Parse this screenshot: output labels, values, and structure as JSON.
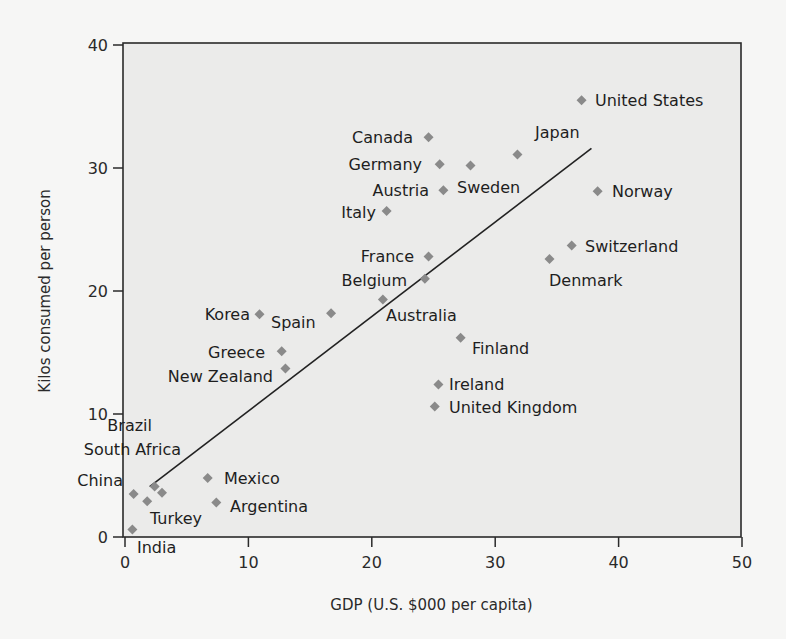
{
  "chart_data": {
    "type": "scatter",
    "title": "",
    "xlabel": "GDP (U.S. $000 per capita)",
    "ylabel": "Kilos consumed per person",
    "xlim": [
      0,
      50
    ],
    "ylim": [
      0,
      40
    ],
    "xticks": [
      0,
      10,
      20,
      30,
      40,
      50
    ],
    "yticks": [
      0,
      10,
      20,
      30,
      40
    ],
    "grid": false,
    "legend": null,
    "marker": {
      "shape": "diamond",
      "color": "#8a8a8a"
    },
    "trendline": {
      "type": "linear",
      "x": [
        2.0,
        37.8
      ],
      "y": [
        4.1,
        31.6
      ],
      "color": "#222222"
    },
    "points": [
      {
        "label": "United States",
        "x": 37.0,
        "y": 35.5,
        "lx": 595,
        "ly": 106,
        "anchor": "start"
      },
      {
        "label": "Japan",
        "x": 31.8,
        "y": 31.1,
        "lx": 535,
        "ly": 138,
        "anchor": "start"
      },
      {
        "label": "Canada",
        "x": 24.6,
        "y": 32.5,
        "lx": 413,
        "ly": 143,
        "anchor": "end"
      },
      {
        "label": "Germany",
        "x": 25.5,
        "y": 30.3,
        "lx": 422,
        "ly": 170,
        "anchor": "end"
      },
      {
        "label": "Sweden",
        "x": 28.0,
        "y": 30.2,
        "lx": 457,
        "ly": 193,
        "anchor": "start"
      },
      {
        "label": "Austria",
        "x": 25.8,
        "y": 28.2,
        "lx": 429,
        "ly": 196,
        "anchor": "end"
      },
      {
        "label": "Norway",
        "x": 38.3,
        "y": 28.1,
        "lx": 612,
        "ly": 197,
        "anchor": "start"
      },
      {
        "label": "Italy",
        "x": 21.2,
        "y": 26.5,
        "lx": 376,
        "ly": 218,
        "anchor": "end"
      },
      {
        "label": "Switzerland",
        "x": 36.2,
        "y": 23.7,
        "lx": 585,
        "ly": 252,
        "anchor": "start"
      },
      {
        "label": "France",
        "x": 24.6,
        "y": 22.8,
        "lx": 414,
        "ly": 262,
        "anchor": "end"
      },
      {
        "label": "Denmark",
        "x": 34.4,
        "y": 22.6,
        "lx": 549,
        "ly": 286,
        "anchor": "start"
      },
      {
        "label": "Belgium",
        "x": 24.3,
        "y": 21.0,
        "lx": 407,
        "ly": 286,
        "anchor": "end"
      },
      {
        "label": "Australia",
        "x": 20.9,
        "y": 19.3,
        "lx": 386,
        "ly": 321,
        "anchor": "start"
      },
      {
        "label": "Korea",
        "x": 10.9,
        "y": 18.1,
        "lx": 250,
        "ly": 320,
        "anchor": "end"
      },
      {
        "label": "Spain",
        "x": 16.7,
        "y": 18.2,
        "lx": 271,
        "ly": 328,
        "anchor": "start"
      },
      {
        "label": "Finland",
        "x": 27.2,
        "y": 16.2,
        "lx": 472,
        "ly": 354,
        "anchor": "start"
      },
      {
        "label": "Greece",
        "x": 12.7,
        "y": 15.1,
        "lx": 265,
        "ly": 358,
        "anchor": "end"
      },
      {
        "label": "New Zealand",
        "x": 13.0,
        "y": 13.7,
        "lx": 273,
        "ly": 382,
        "anchor": "end"
      },
      {
        "label": "Ireland",
        "x": 25.4,
        "y": 12.4,
        "lx": 449,
        "ly": 390,
        "anchor": "start"
      },
      {
        "label": "United Kingdom",
        "x": 25.1,
        "y": 10.6,
        "lx": 449,
        "ly": 413,
        "anchor": "start"
      },
      {
        "label": "Brazil",
        "x": 2.4,
        "y": 4.1,
        "lx": 152,
        "ly": 431,
        "anchor": "end"
      },
      {
        "label": "South Africa",
        "x": 3.0,
        "y": 3.6,
        "lx": 181,
        "ly": 455,
        "anchor": "end"
      },
      {
        "label": "China",
        "x": 0.7,
        "y": 3.5,
        "lx": 123,
        "ly": 486,
        "anchor": "end"
      },
      {
        "label": "Mexico",
        "x": 6.7,
        "y": 4.8,
        "lx": 224,
        "ly": 484,
        "anchor": "start"
      },
      {
        "label": "Argentina",
        "x": 7.4,
        "y": 2.8,
        "lx": 230,
        "ly": 512,
        "anchor": "start"
      },
      {
        "label": "Turkey",
        "x": 1.8,
        "y": 2.9,
        "lx": 150,
        "ly": 524,
        "anchor": "start"
      },
      {
        "label": "India",
        "x": 0.6,
        "y": 0.6,
        "lx": 137,
        "ly": 553,
        "anchor": "start"
      }
    ]
  },
  "layout": {
    "plot_left": 125,
    "plot_right": 742,
    "plot_top": 45,
    "plot_bottom": 537,
    "colors": {
      "plot_bg": "#ebebea",
      "page_bg": "#f6f6f5",
      "axis": "#2a2a2a",
      "marker": "#8a8a8a",
      "trend": "#222222"
    }
  }
}
